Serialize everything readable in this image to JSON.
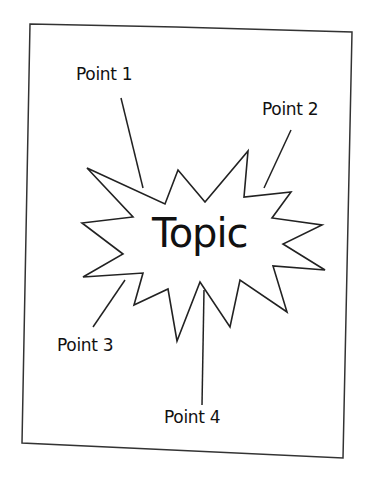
{
  "diagram": {
    "topic": "Topic",
    "points": [
      {
        "label": "Point 1"
      },
      {
        "label": "Point 2"
      },
      {
        "label": "Point 3"
      },
      {
        "label": "Point 4"
      }
    ],
    "colors": {
      "stroke": "#222222",
      "background": "#ffffff",
      "text": "#111111"
    }
  }
}
